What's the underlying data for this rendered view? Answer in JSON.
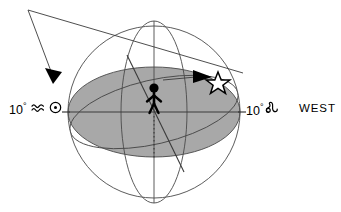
{
  "diagram": {
    "background_color": "#ffffff",
    "line_color": "#3a3a3a",
    "horizon_fill_color": "#a8a8a8",
    "figure_color": "#000000",
    "width": 341,
    "height": 212
  },
  "labels": {
    "left": {
      "degrees": "10",
      "degree_sign": "°",
      "zodiac_sign_name": "aquarius",
      "zodiac_glyph": "≈",
      "body_name": "sun",
      "body_glyph": "☉",
      "full_text": "10° ≈ ☉"
    },
    "right": {
      "degrees": "10",
      "degree_sign": "°",
      "zodiac_sign_name": "leo",
      "zodiac_glyph": "♌",
      "full_text": "10°♌"
    },
    "direction": "WEST"
  },
  "markers": {
    "observer": "stick-figure-observer",
    "star": "open-five-pointed-star",
    "ray_arrow": "incoming-ray-arrowhead",
    "ecliptic_arrow": "ecliptic-direction-arrowhead"
  },
  "geometry": {
    "sphere_center_x": 154,
    "sphere_center_y": 112,
    "sphere_radius": 86,
    "horizon_rx": 86,
    "horizon_ry": 45,
    "meridian_rx": 33,
    "meridian_ry": 91,
    "star_x": 218,
    "star_y": 82,
    "apex_x": 28,
    "apex_y": 10
  }
}
